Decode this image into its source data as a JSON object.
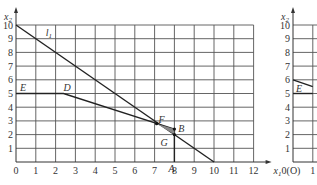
{
  "chart_data": [
    {
      "type": "line",
      "title": "",
      "xlabel": "x1",
      "ylabel": "x2",
      "xlim": [
        0,
        12
      ],
      "ylim": [
        0,
        10
      ],
      "grid": true,
      "x_ticks": [
        "0",
        "1",
        "2",
        "3",
        "4",
        "5",
        "6",
        "7",
        "8",
        "9",
        "10",
        "11",
        "12"
      ],
      "y_ticks": [
        "1",
        "2",
        "3",
        "4",
        "5",
        "6",
        "7",
        "8",
        "9",
        "10"
      ],
      "series": [
        {
          "name": "l1",
          "points": [
            [
              0,
              10
            ],
            [
              10,
              0
            ]
          ]
        },
        {
          "name": "E-D-B",
          "points": [
            [
              0,
              5
            ],
            [
              2.4,
              5
            ],
            [
              8,
              2.4
            ]
          ]
        },
        {
          "name": "A-B",
          "points": [
            [
              8,
              0
            ],
            [
              8,
              2.4
            ]
          ]
        }
      ],
      "annotations": [
        {
          "text": "l1",
          "x": 1.5,
          "y": 9.2
        },
        {
          "text": "E",
          "x": 0.2,
          "y": 5.4
        },
        {
          "text": "D",
          "x": 2.4,
          "y": 5.4
        },
        {
          "text": "F",
          "x": 7.2,
          "y": 3.1
        },
        {
          "text": "B",
          "x": 8.2,
          "y": 2.4
        },
        {
          "text": "G",
          "x": 7.3,
          "y": 1.4
        },
        {
          "text": "A",
          "x": 7.7,
          "y": -0.5
        }
      ],
      "points": [
        {
          "name": "F",
          "x": 7.1,
          "y": 2.8
        },
        {
          "name": "B",
          "x": 8,
          "y": 2.4
        },
        {
          "name": "G",
          "x": 8,
          "y": 2
        }
      ]
    },
    {
      "type": "line",
      "title": "",
      "xlabel": "",
      "ylabel": "x2",
      "ylim": [
        0,
        10
      ],
      "grid": true,
      "x_ticks": [
        "0(O)",
        "1"
      ],
      "y_ticks": [
        "1",
        "2",
        "3",
        "4",
        "5",
        "6",
        "7",
        "8",
        "9",
        "10"
      ],
      "series": [
        {
          "name": "E-line",
          "points": [
            [
              0,
              6
            ],
            [
              1,
              5.5
            ]
          ]
        },
        {
          "name": "x2=5",
          "points": [
            [
              0,
              5
            ],
            [
              1,
              5
            ]
          ]
        }
      ],
      "annotations": [
        {
          "text": "E",
          "x": 0.1,
          "y": 5.3
        }
      ]
    }
  ],
  "left": {
    "y_axis_label": "x2",
    "x_axis_label": "x1",
    "x_ticks": [
      "0",
      "1",
      "2",
      "3",
      "4",
      "5",
      "6",
      "7",
      "8",
      "9",
      "10",
      "11",
      "12"
    ],
    "y_ticks": [
      "1",
      "2",
      "3",
      "4",
      "5",
      "6",
      "7",
      "8",
      "9",
      "10"
    ],
    "labels": {
      "l1": "l1",
      "E": "E",
      "D": "D",
      "F": "F",
      "B": "B",
      "G": "G",
      "A": "A"
    }
  },
  "right": {
    "y_axis_label": "x2",
    "x_ticks": [
      "0(O)",
      "1"
    ],
    "y_ticks": [
      "1",
      "2",
      "3",
      "4",
      "5",
      "6",
      "7",
      "8",
      "9",
      "10"
    ],
    "labels": {
      "E": "E"
    }
  }
}
